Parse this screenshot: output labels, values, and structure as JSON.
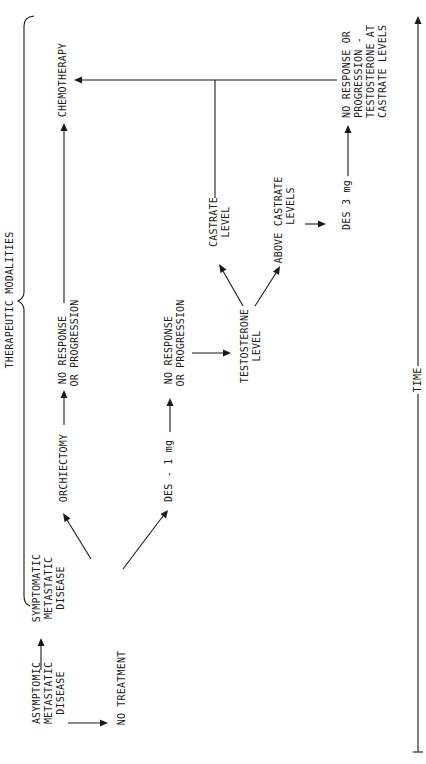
{
  "diagram": {
    "orientation": "rotated-90-ccw",
    "group_label": "THERAPEUTIC MODALITIES",
    "axis_label": "TIME",
    "nodes": {
      "asymptomatic": [
        "ASYMPTOMIC",
        "METASTATIC",
        "DISEASE"
      ],
      "no_treatment": [
        "NO TREATMENT"
      ],
      "symptomatic": [
        "SYMPTOMATIC",
        "METASTATIC",
        "DISEASE"
      ],
      "orchiectomy": [
        "ORCHIECTOMY"
      ],
      "orch_no_response": [
        "NO RESPONSE",
        "OR PROGRESSION"
      ],
      "des1": [
        "DES - 1 mg"
      ],
      "des1_no_response": [
        "NO RESPONSE",
        "OR PROGRESSION"
      ],
      "testosterone": [
        "TESTOSTERONE",
        "LEVEL"
      ],
      "castrate": [
        "CASTRATE",
        "LEVEL"
      ],
      "above_castrate": [
        "ABOVE CASTRATE",
        "LEVELS"
      ],
      "des3": [
        "DES 3 mg"
      ],
      "des3_no_response": [
        "NO RESPONSE OR",
        "PROGRESSION -",
        "TESTOSTERONE AT",
        "CASTRATE LEVELS"
      ],
      "chemotherapy": [
        "CHEMOTHERAPY"
      ]
    },
    "edges": [
      [
        "asymptomatic",
        "symptomatic"
      ],
      [
        "asymptomatic",
        "no_treatment"
      ],
      [
        "symptomatic",
        "orchiectomy"
      ],
      [
        "symptomatic",
        "des1"
      ],
      [
        "orchiectomy",
        "orch_no_response"
      ],
      [
        "orch_no_response",
        "chemotherapy"
      ],
      [
        "des1",
        "des1_no_response"
      ],
      [
        "des1_no_response",
        "testosterone"
      ],
      [
        "testosterone",
        "castrate"
      ],
      [
        "testosterone",
        "above_castrate"
      ],
      [
        "above_castrate",
        "des3"
      ],
      [
        "des3",
        "des3_no_response"
      ],
      [
        "castrate",
        "chemotherapy"
      ],
      [
        "des3_no_response",
        "chemotherapy"
      ]
    ],
    "colors": {
      "ink": "#1a1a1a",
      "background": "#ffffff"
    }
  }
}
